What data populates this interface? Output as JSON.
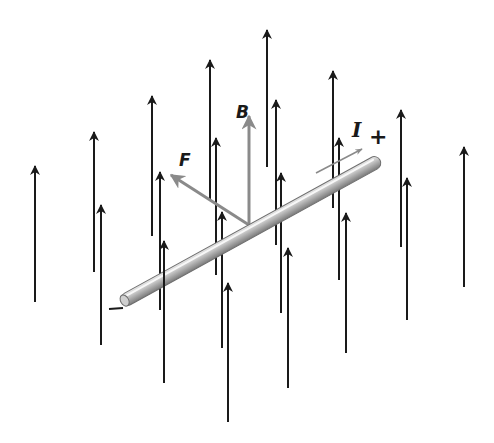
{
  "figure": {
    "colors": {
      "field_lines": "#1a1a1a",
      "vectors": "#8a8a8a",
      "rod_light": "#e8e8e8",
      "rod_mid": "#b5b5b5",
      "rod_dark": "#7a7a7a"
    },
    "labels": {
      "magnetic_field": "B",
      "force": "F",
      "current": "I",
      "positive_terminal": "+",
      "negative_terminal": "−"
    },
    "field_arrows": [
      {
        "x": 35,
        "tip": 166,
        "bottom": 302,
        "behind_rod": false
      },
      {
        "x": 94,
        "tip": 132,
        "bottom": 272,
        "behind_rod": false
      },
      {
        "x": 101,
        "tip": 205,
        "bottom": 345,
        "behind_rod": false
      },
      {
        "x": 152,
        "tip": 96,
        "bottom": 236,
        "behind_rod": true
      },
      {
        "x": 160,
        "tip": 172,
        "bottom": 310,
        "behind_rod": true
      },
      {
        "x": 164,
        "tip": 241,
        "bottom": 383,
        "behind_rod": false
      },
      {
        "x": 210,
        "tip": 60,
        "bottom": 200,
        "behind_rod": true
      },
      {
        "x": 216,
        "tip": 138,
        "bottom": 275,
        "behind_rod": true
      },
      {
        "x": 222,
        "tip": 212,
        "bottom": 348,
        "behind_rod": true
      },
      {
        "x": 228,
        "tip": 283,
        "bottom": 422,
        "behind_rod": false
      },
      {
        "x": 267,
        "tip": 30,
        "bottom": 167,
        "behind_rod": true
      },
      {
        "x": 276,
        "tip": 100,
        "bottom": 245,
        "behind_rod": true
      },
      {
        "x": 281,
        "tip": 173,
        "bottom": 313,
        "behind_rod": true
      },
      {
        "x": 288,
        "tip": 248,
        "bottom": 388,
        "behind_rod": false
      },
      {
        "x": 333,
        "tip": 71,
        "bottom": 208,
        "behind_rod": true
      },
      {
        "x": 339,
        "tip": 138,
        "bottom": 280,
        "behind_rod": true
      },
      {
        "x": 346,
        "tip": 213,
        "bottom": 353,
        "behind_rod": false
      },
      {
        "x": 401,
        "tip": 110,
        "bottom": 247,
        "behind_rod": false
      },
      {
        "x": 407,
        "tip": 178,
        "bottom": 320,
        "behind_rod": false
      },
      {
        "x": 464,
        "tip": 147,
        "bottom": 287,
        "behind_rod": false
      }
    ],
    "rod": {
      "x1": 122,
      "y1": 302,
      "x2": 380,
      "y2": 160,
      "thickness": 13
    },
    "b_vector": {
      "x": 249,
      "base": 225,
      "tip": 116
    },
    "f_vector": {
      "x1": 249,
      "y1": 225,
      "x2": 171,
      "y2": 175
    },
    "current_arrow": {
      "x1": 316,
      "y1": 173,
      "x2": 362,
      "y2": 149
    }
  }
}
